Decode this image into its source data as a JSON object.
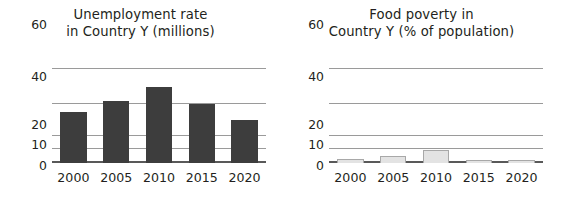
{
  "chart_data": [
    {
      "type": "bar",
      "panel": "left",
      "title": "Unemployment rate in Country Y (millions)",
      "title_line1": "Unemployment rate",
      "title_line2": "in Country Y (millions)",
      "xlabel": "",
      "ylabel": "",
      "categories": [
        "2000",
        "2005",
        "2010",
        "2015",
        "2020"
      ],
      "values": [
        35,
        42,
        50,
        40,
        30
      ],
      "ytick_labels": [
        "0",
        "10",
        "20",
        "40",
        "60"
      ],
      "ytick_values": [
        0,
        10,
        20,
        40,
        60
      ],
      "ylim": [
        0,
        60
      ],
      "grid": true,
      "legend": "none",
      "bar_color": "#3d3d3d"
    },
    {
      "type": "bar",
      "panel": "right",
      "title": "Food poverty in Country Y (% of population)",
      "title_line1": "Food poverty in",
      "title_line2": "Country Y (% of population)",
      "xlabel": "",
      "ylabel": "",
      "categories": [
        "2000",
        "2005",
        "2010",
        "2015",
        "2020"
      ],
      "values": [
        3,
        5,
        9,
        2.5,
        2
      ],
      "ytick_labels": [
        "0",
        "10",
        "20",
        "40",
        "60"
      ],
      "ytick_values": [
        0,
        10,
        20,
        40,
        60
      ],
      "ylim": [
        0,
        60
      ],
      "grid": true,
      "legend": "none",
      "bar_color": "#e3e3e3",
      "bar_border_color": "#a8a8a8"
    }
  ]
}
